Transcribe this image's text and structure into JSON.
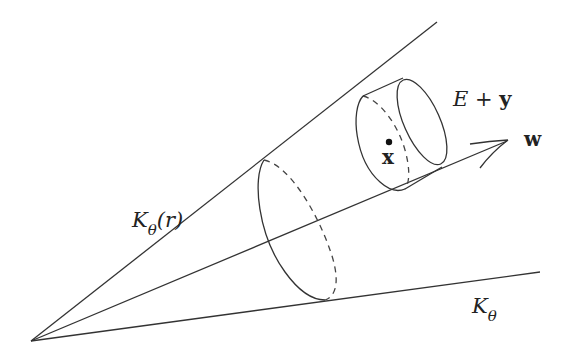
{
  "diagram": {
    "labels": {
      "upper_cone": {
        "main": "K",
        "sub": "θ",
        "suffix": "(r)"
      },
      "lower_cone": {
        "main": "K",
        "sub": "θ"
      },
      "cylinder": {
        "main": "E",
        "op": " + ",
        "vec": "y"
      },
      "point": "x",
      "direction": "w"
    },
    "colors": {
      "stroke": "#333333",
      "background": "#ffffff"
    }
  }
}
